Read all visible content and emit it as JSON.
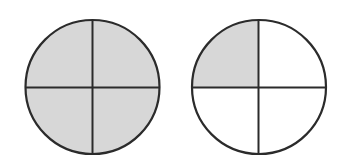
{
  "diagram": {
    "colors": {
      "stroke": "#2b2b2b",
      "shaded_fill": "#d7d7d7",
      "unshaded_fill": "#ffffff",
      "background": "#ffffff"
    },
    "circles": [
      {
        "id": "left-circle",
        "label": "4/4 shaded",
        "parts": 4,
        "shaded_quarters": [
          "top-left",
          "top-right",
          "bottom-left",
          "bottom-right"
        ],
        "shaded_count": 4
      },
      {
        "id": "right-circle",
        "label": "1/4 shaded",
        "parts": 4,
        "shaded_quarters": [
          "top-left"
        ],
        "shaded_count": 1
      }
    ]
  }
}
